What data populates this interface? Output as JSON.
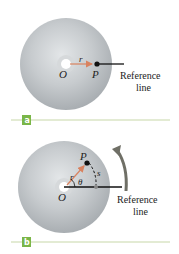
{
  "panels": [
    {
      "id": "a",
      "tag_label": "a",
      "labels": {
        "center": "O",
        "point": "P",
        "radius": "r"
      },
      "reference_label_line1": "Reference",
      "reference_label_line2": "line"
    },
    {
      "id": "b",
      "tag_label": "b",
      "labels": {
        "center": "O",
        "point": "P",
        "radius": "r",
        "angle": "θ",
        "arc": "s"
      },
      "reference_label_line1": "Reference",
      "reference_label_line2": "line"
    }
  ],
  "colors": {
    "disc": "#c9cdd0",
    "tag_bg": "#7ab648",
    "divider": "#c7d7a8",
    "radius_arrow": "#d9825f",
    "rotation_arrow": "#6f6f66"
  }
}
